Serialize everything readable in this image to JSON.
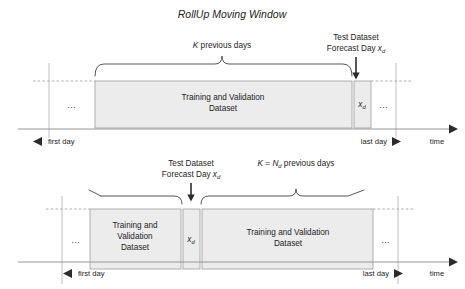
{
  "figure": {
    "title": "RollUp Moving Window",
    "panels": [
      {
        "id": "top",
        "brace_label": "K previous days",
        "brace_label_italic": "K",
        "brace_label_rest": " previous days",
        "test_label_line1": "Test Dataset",
        "test_label_line2_a": "Forecast Day ",
        "test_label_line2_b": "x",
        "test_label_line2_sub": "d",
        "boxes": [
          {
            "name": "training-validation-dataset",
            "line1": "Training and Validation",
            "line2": "Dataset"
          },
          {
            "name": "forecast-day-box",
            "symbol": "x",
            "subscript": "d"
          }
        ],
        "ellipsis_left": "…",
        "ellipsis_right": "…",
        "axis": {
          "first_day": "first day",
          "last_day": "last day",
          "time": "time"
        }
      },
      {
        "id": "bottom",
        "brace_label_a": "K",
        "brace_label_b": " = ",
        "brace_label_c": "N",
        "brace_label_sub": "d",
        "brace_label_d": " previous days",
        "test_label_line1": "Test Dataset",
        "test_label_line2_a": "Forecast Day ",
        "test_label_line2_b": "x",
        "test_label_line2_sub": "d",
        "boxes": [
          {
            "name": "training-validation-dataset-left",
            "line1": "Training and",
            "line2": "Validation",
            "line3": "Dataset"
          },
          {
            "name": "forecast-day-box",
            "symbol": "x",
            "subscript": "d"
          },
          {
            "name": "training-validation-dataset-right",
            "line1": "Training and Validation",
            "line2": "Dataset"
          }
        ],
        "ellipsis_left": "…",
        "ellipsis_right": "…",
        "axis": {
          "first_day": "first day",
          "last_day": "last day",
          "time": "time"
        }
      }
    ],
    "colors": {
      "box_fill": "#ececec",
      "box_stroke": "#9d9d9d",
      "axis": "#8c8c8c",
      "text": "#1c1c1c"
    }
  }
}
